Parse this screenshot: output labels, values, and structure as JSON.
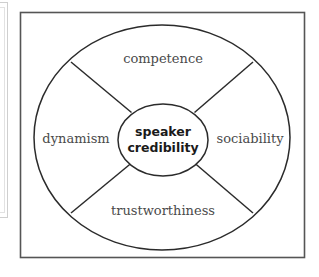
{
  "figure": {
    "type": "radial-wheel-diagram",
    "frame": {
      "border_color": "#555555",
      "background": "#ffffff"
    },
    "center": {
      "line1": "speaker",
      "line2": "credibility",
      "text_color": "#1a1a1a",
      "bold": true
    },
    "segments": [
      {
        "id": "competence",
        "label": "competence",
        "position": "top"
      },
      {
        "id": "sociability",
        "label": "sociability",
        "position": "right"
      },
      {
        "id": "trustworthiness",
        "label": "trustworthiness",
        "position": "bottom"
      },
      {
        "id": "dynamism",
        "label": "dynamism",
        "position": "left"
      }
    ],
    "segment_label_color": "#4a4a4a",
    "stroke_color": "#2b2b2b"
  }
}
